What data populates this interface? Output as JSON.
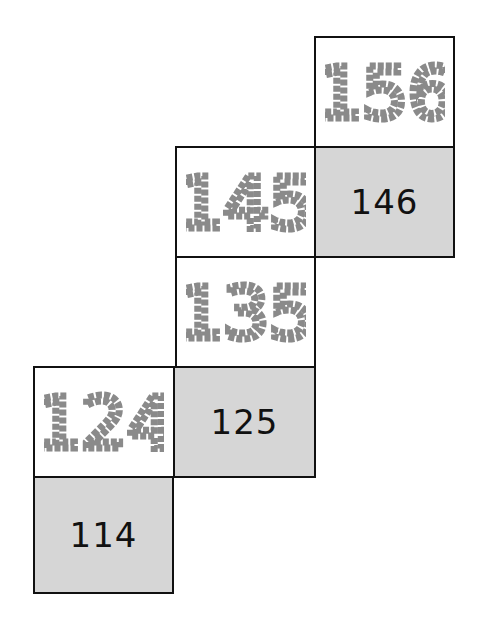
{
  "diagram": {
    "cells": [
      {
        "id": "156",
        "value": "156",
        "style": "dashed-outline",
        "col": 2,
        "row": 0
      },
      {
        "id": "145",
        "value": "145",
        "style": "dashed-outline",
        "col": 1,
        "row": 1
      },
      {
        "id": "146",
        "value": "146",
        "style": "solid",
        "col": 2,
        "row": 1
      },
      {
        "id": "135",
        "value": "135",
        "style": "dashed-outline",
        "col": 1,
        "row": 2
      },
      {
        "id": "124",
        "value": "124",
        "style": "dashed-outline",
        "col": 0,
        "row": 3
      },
      {
        "id": "125",
        "value": "125",
        "style": "solid",
        "col": 1,
        "row": 3
      },
      {
        "id": "114",
        "value": "114",
        "style": "solid",
        "col": 0,
        "row": 4
      }
    ],
    "colors": {
      "border": "#111111",
      "shaded": "#d6d6d6",
      "dashed_digit": "#8a8a8a",
      "solid_digit": "#111111"
    }
  }
}
